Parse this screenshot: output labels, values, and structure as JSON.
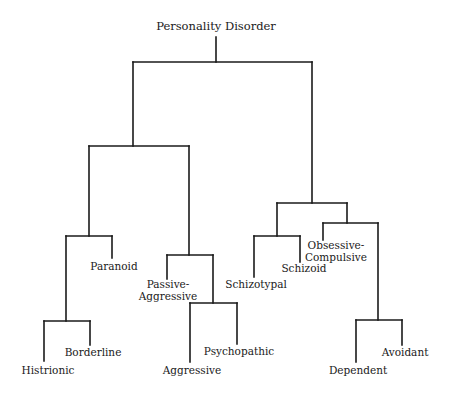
{
  "diagram": {
    "type": "dendrogram",
    "root_label": "Personality Disorder",
    "root_label_pos": [
      216,
      30
    ],
    "stroke_color": "#1a1a1a",
    "background": "#ffffff",
    "segments": [
      {
        "id": "root-stem",
        "x1": 216,
        "y1": 37,
        "x2": 216,
        "y2": 62
      },
      {
        "id": "root-bar",
        "x1": 133,
        "y1": 62,
        "x2": 312,
        "y2": 62
      },
      {
        "id": "left-stem",
        "x1": 133,
        "y1": 62,
        "x2": 133,
        "y2": 146
      },
      {
        "id": "left-bar",
        "x1": 89,
        "y1": 146,
        "x2": 189,
        "y2": 146
      },
      {
        "id": "hbp-stem",
        "x1": 89,
        "y1": 146,
        "x2": 89,
        "y2": 236
      },
      {
        "id": "hbp-bar",
        "x1": 66,
        "y1": 236,
        "x2": 112,
        "y2": 236
      },
      {
        "id": "paranoid-leaf",
        "x1": 112,
        "y1": 236,
        "x2": 112,
        "y2": 258
      },
      {
        "id": "hb-stem",
        "x1": 66,
        "y1": 236,
        "x2": 66,
        "y2": 321
      },
      {
        "id": "hb-bar",
        "x1": 44,
        "y1": 321,
        "x2": 90,
        "y2": 321
      },
      {
        "id": "histrionic-leaf",
        "x1": 44,
        "y1": 321,
        "x2": 44,
        "y2": 361
      },
      {
        "id": "borderline-leaf",
        "x1": 90,
        "y1": 321,
        "x2": 90,
        "y2": 345
      },
      {
        "id": "pa-stem",
        "x1": 189,
        "y1": 146,
        "x2": 189,
        "y2": 255
      },
      {
        "id": "pa-bar",
        "x1": 167,
        "y1": 255,
        "x2": 213,
        "y2": 255
      },
      {
        "id": "passive-aggressive-leaf",
        "x1": 167,
        "y1": 255,
        "x2": 167,
        "y2": 279
      },
      {
        "id": "ap-stem",
        "x1": 213,
        "y1": 255,
        "x2": 213,
        "y2": 303
      },
      {
        "id": "ap-bar",
        "x1": 190,
        "y1": 303,
        "x2": 237,
        "y2": 303
      },
      {
        "id": "aggressive-leaf",
        "x1": 190,
        "y1": 303,
        "x2": 190,
        "y2": 362
      },
      {
        "id": "psychopathic-leaf",
        "x1": 237,
        "y1": 303,
        "x2": 237,
        "y2": 344
      },
      {
        "id": "right-stem",
        "x1": 312,
        "y1": 62,
        "x2": 312,
        "y2": 203
      },
      {
        "id": "right-bar",
        "x1": 277,
        "y1": 203,
        "x2": 347,
        "y2": 203
      },
      {
        "id": "schizo-stem",
        "x1": 277,
        "y1": 203,
        "x2": 277,
        "y2": 236
      },
      {
        "id": "schizo-bar",
        "x1": 254,
        "y1": 236,
        "x2": 300,
        "y2": 236
      },
      {
        "id": "schizotypal-leaf",
        "x1": 254,
        "y1": 236,
        "x2": 254,
        "y2": 277
      },
      {
        "id": "schizoid-leaf",
        "x1": 300,
        "y1": 236,
        "x2": 300,
        "y2": 262
      },
      {
        "id": "ocda-stem",
        "x1": 347,
        "y1": 203,
        "x2": 347,
        "y2": 223
      },
      {
        "id": "ocda-bar",
        "x1": 323,
        "y1": 223,
        "x2": 378,
        "y2": 223
      },
      {
        "id": "obsessive-compulsive-leaf",
        "x1": 323,
        "y1": 223,
        "x2": 323,
        "y2": 240
      },
      {
        "id": "da-stem",
        "x1": 378,
        "y1": 223,
        "x2": 378,
        "y2": 320
      },
      {
        "id": "da-bar",
        "x1": 356,
        "y1": 320,
        "x2": 402,
        "y2": 320
      },
      {
        "id": "dependent-leaf",
        "x1": 356,
        "y1": 320,
        "x2": 356,
        "y2": 362
      },
      {
        "id": "avoidant-leaf",
        "x1": 402,
        "y1": 320,
        "x2": 402,
        "y2": 345
      }
    ],
    "leaves": [
      {
        "name": "paranoid",
        "lines": [
          "Paranoid"
        ],
        "x": 114,
        "y": 270
      },
      {
        "name": "histrionic",
        "lines": [
          "Histrionic"
        ],
        "x": 48,
        "y": 374
      },
      {
        "name": "borderline",
        "lines": [
          "Borderline"
        ],
        "x": 93,
        "y": 356
      },
      {
        "name": "passive-aggressive",
        "lines": [
          "Passive-",
          "Aggressive"
        ],
        "x": 168,
        "y": 288
      },
      {
        "name": "aggressive",
        "lines": [
          "Aggressive"
        ],
        "x": 192,
        "y": 374
      },
      {
        "name": "psychopathic",
        "lines": [
          "Psychopathic"
        ],
        "x": 239,
        "y": 355
      },
      {
        "name": "schizotypal",
        "lines": [
          "Schizotypal"
        ],
        "x": 256,
        "y": 288
      },
      {
        "name": "schizoid",
        "lines": [
          "Schizoid"
        ],
        "x": 304,
        "y": 272
      },
      {
        "name": "obsessive-compulsive",
        "lines": [
          "Obsessive-",
          "Compulsive"
        ],
        "x": 336,
        "y": 249
      },
      {
        "name": "dependent",
        "lines": [
          "Dependent"
        ],
        "x": 358,
        "y": 374
      },
      {
        "name": "avoidant",
        "lines": [
          "Avoidant"
        ],
        "x": 405,
        "y": 356
      }
    ]
  }
}
